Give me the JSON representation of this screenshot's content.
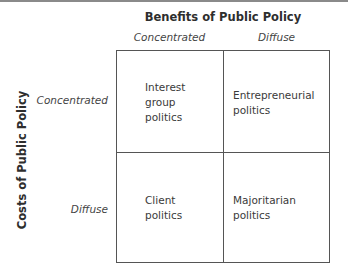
{
  "diagram": {
    "type": "2x2 matrix",
    "column_axis": {
      "title": "Benefits of Public Policy",
      "labels": [
        "Concentrated",
        "Diffuse"
      ]
    },
    "row_axis": {
      "title": "Costs of Public Policy",
      "labels": [
        "Concentrated",
        "Diffuse"
      ]
    },
    "cells": [
      {
        "row": "Concentrated",
        "col": "Concentrated",
        "text": "Interest\ngroup\npolitics"
      },
      {
        "row": "Concentrated",
        "col": "Diffuse",
        "text": "Entrepreneurial\npolitics"
      },
      {
        "row": "Diffuse",
        "col": "Concentrated",
        "text": "Client\npolitics"
      },
      {
        "row": "Diffuse",
        "col": "Diffuse",
        "text": "Majoritarian\npolitics"
      }
    ]
  }
}
